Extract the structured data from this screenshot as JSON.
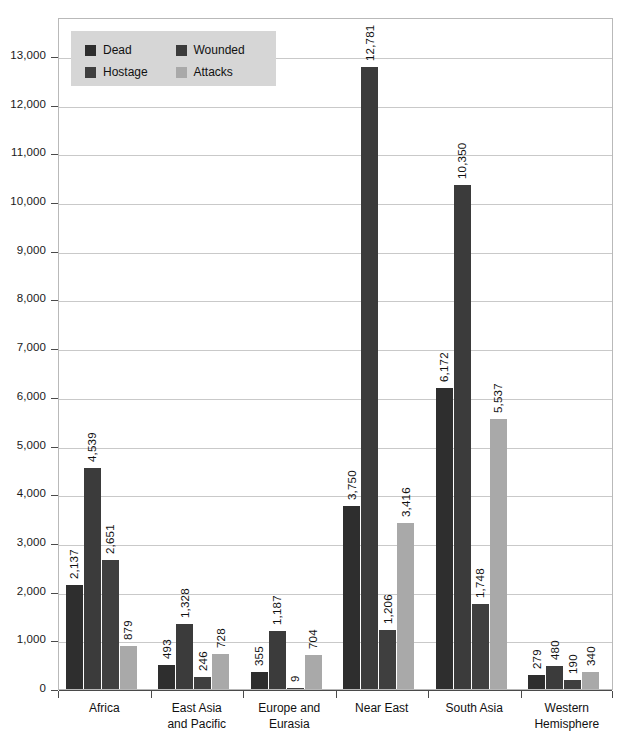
{
  "chart_data": {
    "type": "bar",
    "title": "",
    "subtitle": "",
    "xlabel": "",
    "ylabel": "",
    "ylim": [
      0,
      13800
    ],
    "ytick_values": [
      0,
      1000,
      2000,
      3000,
      4000,
      5000,
      6000,
      7000,
      8000,
      9000,
      10000,
      11000,
      12000,
      13000
    ],
    "ytick_labels": [
      "0",
      "1,000",
      "2,000",
      "3,000",
      "4,000",
      "5,000",
      "6,000",
      "7,000",
      "8,000",
      "9,000",
      "10,000",
      "11,000",
      "12,000",
      "13,000"
    ],
    "grid": true,
    "legend_position": "top-left",
    "categories": [
      "Africa",
      "East Asia and Pacific",
      "Europe and Eurasia",
      "Near East",
      "South Asia",
      "Western Hemisphere"
    ],
    "category_lines": [
      [
        "Africa"
      ],
      [
        "East Asia",
        "and Pacific"
      ],
      [
        "Europe and",
        "Eurasia"
      ],
      [
        "Near East"
      ],
      [
        "South Asia"
      ],
      [
        "Western",
        "Hemisphere"
      ]
    ],
    "series": [
      {
        "name": "Dead",
        "color": "#2e2e2e",
        "values": [
          2137,
          493,
          355,
          3750,
          6172,
          279
        ],
        "labels": [
          "2,137",
          "493",
          "355",
          "3,750",
          "6,172",
          "279"
        ]
      },
      {
        "name": "Wounded",
        "color": "#3b3b3b",
        "values": [
          4539,
          1328,
          1187,
          12781,
          10350,
          480
        ],
        "labels": [
          "4,539",
          "1,328",
          "1,187",
          "12,781",
          "10,350",
          "480"
        ]
      },
      {
        "name": "Hostage",
        "color": "#3f3f3f",
        "values": [
          2651,
          246,
          9,
          1206,
          1748,
          190
        ],
        "labels": [
          "2,651",
          "246",
          "9",
          "1,206",
          "1,748",
          "190"
        ]
      },
      {
        "name": "Attacks",
        "color": "#a9a9a9",
        "values": [
          879,
          728,
          704,
          3416,
          5537,
          340
        ],
        "labels": [
          "879",
          "728",
          "704",
          "3,416",
          "5,537",
          "340"
        ]
      }
    ]
  },
  "legend": {
    "items": [
      {
        "label": "Dead",
        "color": "#2e2e2e"
      },
      {
        "label": "Wounded",
        "color": "#3b3b3b"
      },
      {
        "label": "Hostage",
        "color": "#3f3f3f"
      },
      {
        "label": "Attacks",
        "color": "#a9a9a9"
      }
    ],
    "background": "#d6d6d6"
  },
  "axis": {
    "gridline_color": "#c9c9c9",
    "axis_color": "#4a4a4a",
    "frame_color": "#b9b9b9"
  }
}
